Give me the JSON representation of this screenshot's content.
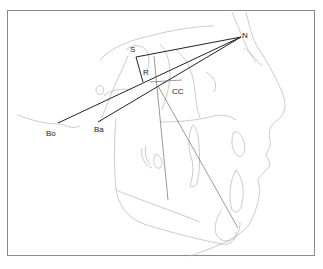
{
  "diagram": {
    "type": "cephalometric tracing",
    "landmarks": [
      {
        "id": "S",
        "label": "S",
        "x": 136,
        "y": 57
      },
      {
        "id": "N",
        "label": "N",
        "x": 241,
        "y": 37
      },
      {
        "id": "R",
        "label": "R",
        "x": 143,
        "y": 82
      },
      {
        "id": "CC",
        "label": "CC",
        "x": 158,
        "y": 86
      },
      {
        "id": "Ba",
        "label": "Ba",
        "x": 98,
        "y": 122
      },
      {
        "id": "Bo",
        "label": "Bo",
        "x": 58,
        "y": 123
      }
    ],
    "lines": [
      {
        "from": "S",
        "to": "N"
      },
      {
        "from": "Bo",
        "to": "N"
      },
      {
        "from": "Ba",
        "to": "N"
      },
      {
        "from": "S",
        "to": "R"
      }
    ],
    "labels": {
      "S": "S",
      "N": "N",
      "R": "R",
      "CC": "CC",
      "Ba": "Ba",
      "Bo": "Bo"
    },
    "colors": {
      "construction_line": "#222222",
      "anatomy_trace": "#b0b0b0",
      "frame": "#8a8a8a"
    }
  }
}
